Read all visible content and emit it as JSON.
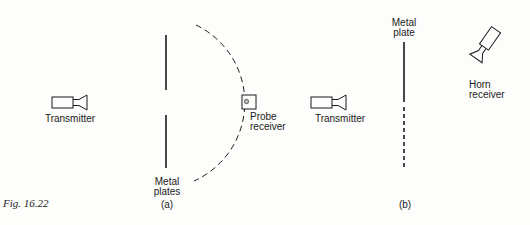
{
  "figure": {
    "caption": "Fig. 16.22",
    "panel_a": {
      "label": "(a)",
      "transmitter_label": "Transmitter",
      "plates_label_line1": "Metal",
      "plates_label_line2": "plates",
      "probe_label_line1": "Probe",
      "probe_label_line2": "receiver"
    },
    "panel_b": {
      "label": "(b)",
      "transmitter_label": "Transmitter",
      "plate_label_line1": "Metal",
      "plate_label_line2": "plate",
      "horn_label_line1": "Horn",
      "horn_label_line2": "receiver"
    }
  },
  "colors": {
    "ink": "#1a1a1a",
    "background": "#fdfdfc"
  }
}
